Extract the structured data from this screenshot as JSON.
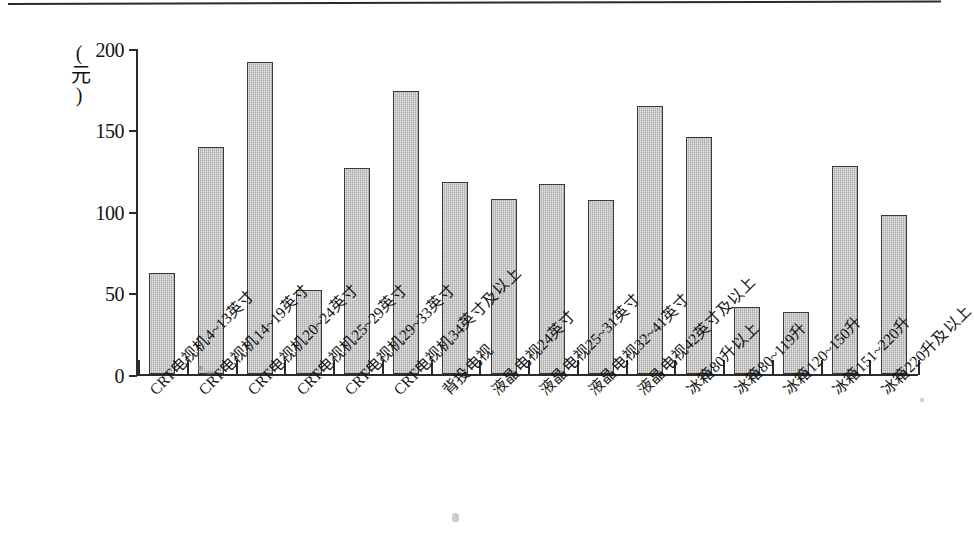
{
  "figure": {
    "background_color": "#ffffff",
    "axis_color": "#2b2b2b",
    "bar_fill_color": "#c2c2c2",
    "bar_edge_color": "#3a3a3a"
  },
  "chart_data": {
    "type": "bar",
    "title": "",
    "subtitle": "",
    "xlabel": "",
    "ylabel": "(元)",
    "ylim": [
      0,
      200
    ],
    "yticks": [
      0,
      50,
      100,
      150,
      200
    ],
    "ytick_labels": [
      "0",
      "50",
      "100",
      "150",
      "200"
    ],
    "grid": false,
    "legend": false,
    "legend_position": "none",
    "categories": [
      "CRT电视机4~13英寸",
      "CRT电视机14~19英寸",
      "CRT电视机20~24英寸",
      "CRT电视机25~29英寸",
      "CRT电视机29~33英寸",
      "CRT电视机34英寸及以上",
      "背投电视",
      "液晶电视24英寸",
      "液晶电视25~31英寸",
      "液晶电视32~41英寸",
      "液晶电视42英寸及以上",
      "冰箱80升以上",
      "冰箱80~119升",
      "冰箱120~150升",
      "冰箱151~220升",
      "冰箱220升及以上"
    ],
    "values": [
      62,
      140,
      192,
      52,
      127,
      174,
      118,
      108,
      117,
      107,
      165,
      146,
      41,
      38,
      128,
      98
    ]
  }
}
